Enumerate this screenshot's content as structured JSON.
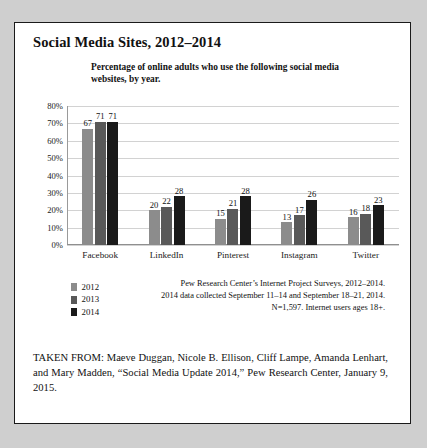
{
  "page": {
    "title": "Social Media Sites, 2012–2014"
  },
  "chart_data": {
    "type": "bar",
    "title": "",
    "subtitle": "Percentage of online adults who use the following social media websites, by year.",
    "categories": [
      "Facebook",
      "LinkedIn",
      "Pinterest",
      "Instagram",
      "Twitter"
    ],
    "series": [
      {
        "name": "2012",
        "color": "#8c8c8c",
        "values": [
          67,
          20,
          15,
          13,
          16
        ]
      },
      {
        "name": "2013",
        "color": "#595959",
        "values": [
          71,
          22,
          21,
          17,
          18
        ]
      },
      {
        "name": "2014",
        "color": "#1a1a1a",
        "values": [
          71,
          28,
          28,
          26,
          23
        ]
      }
    ],
    "xlabel": "",
    "ylabel": "",
    "ylim": [
      0,
      80
    ],
    "ytick_labels": [
      "80%",
      "70%",
      "60%",
      "50%",
      "40%",
      "30%",
      "20%",
      "10%",
      "0%"
    ],
    "ytick_values": [
      80,
      70,
      60,
      50,
      40,
      30,
      20,
      10,
      0
    ],
    "grid": true,
    "legend_position": "bottom-left",
    "value_labels": true
  },
  "source_note": {
    "line1": "Pew Research Center’s Internet Project Surveys, 2012–2014.",
    "line2": "2014 data collected September 11–14 and September 18–21, 2014.",
    "line3": "N=1,597. Internet users ages 18+."
  },
  "attribution": {
    "text": "TAKEN FROM: Maeve Duggan, Nicole B. Ellison, Cliff Lampe, Amanda Lenhart, and Mary Madden, “Social Media Update 2014,” Pew Research Center, January 9, 2015."
  }
}
